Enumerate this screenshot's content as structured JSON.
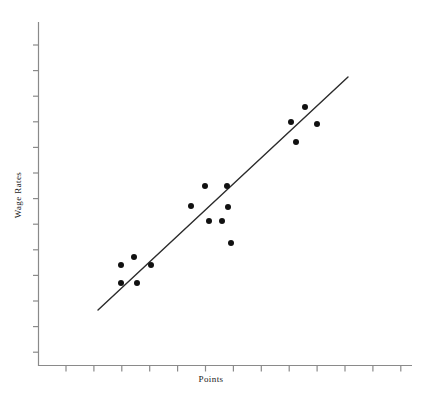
{
  "chart_data": {
    "type": "scatter",
    "title": "",
    "xlabel": "Points",
    "ylabel": "Wage Rates",
    "grid": false,
    "legend": false,
    "axis_tick_labels_shown": false,
    "xlim": [
      0,
      14
    ],
    "ylim": [
      0,
      13
    ],
    "x_ticks": [
      1,
      2,
      3,
      4,
      5,
      6,
      7,
      8,
      9,
      10,
      11,
      12,
      13
    ],
    "y_ticks": [
      1,
      2,
      3,
      4,
      5,
      6,
      7,
      8,
      9,
      10,
      11,
      12,
      13
    ],
    "marker_color": "#111111",
    "marker_radius_px": 3,
    "line_color": "#2b2b2b",
    "axis_color": "#8a8a8a",
    "points": [
      {
        "x": 3.0,
        "y": 4.35,
        "px": 121,
        "py": 265
      },
      {
        "x": 3.0,
        "y": 3.6,
        "px": 121,
        "py": 283
      },
      {
        "x": 3.6,
        "y": 4.7,
        "px": 134,
        "py": 257
      },
      {
        "x": 3.7,
        "y": 3.6,
        "px": 137,
        "py": 283
      },
      {
        "x": 4.35,
        "y": 4.35,
        "px": 151,
        "py": 265
      },
      {
        "x": 6.15,
        "y": 6.1,
        "px": 191,
        "py": 206
      },
      {
        "x": 6.6,
        "y": 7.25,
        "px": 205,
        "py": 186
      },
      {
        "x": 6.75,
        "y": 5.7,
        "px": 209,
        "py": 221
      },
      {
        "x": 7.15,
        "y": 5.7,
        "px": 222,
        "py": 221
      },
      {
        "x": 7.35,
        "y": 7.25,
        "px": 227,
        "py": 186
      },
      {
        "x": 7.35,
        "y": 6.1,
        "px": 228,
        "py": 207
      },
      {
        "x": 7.55,
        "y": 5.0,
        "px": 231,
        "py": 243
      },
      {
        "x": 9.4,
        "y": 9.6,
        "px": 291,
        "py": 122
      },
      {
        "x": 9.55,
        "y": 8.9,
        "px": 296,
        "py": 142
      },
      {
        "x": 9.9,
        "y": 10.2,
        "px": 305,
        "py": 107
      },
      {
        "x": 10.4,
        "y": 9.55,
        "px": 317,
        "py": 124
      }
    ],
    "trend_line": {
      "label": "regression-line",
      "x1_px": 98,
      "y1_px": 310,
      "x2_px": 348,
      "y2_px": 77
    }
  },
  "axes": {
    "x_title": "Points",
    "y_title": "Wage Rates"
  }
}
